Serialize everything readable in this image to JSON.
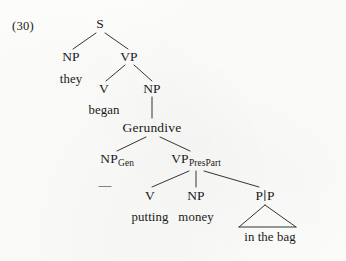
{
  "figure": {
    "example_number": "(30)",
    "background_color": "#fdfdfc",
    "ink_color": "#1a1a1a"
  },
  "tree": {
    "nodes": [
      {
        "id": "s",
        "label": "S",
        "x": 100,
        "y": 24,
        "kind": "category"
      },
      {
        "id": "np1",
        "label": "NP",
        "x": 71,
        "y": 57,
        "kind": "category"
      },
      {
        "id": "they",
        "label": "they",
        "x": 71,
        "y": 79,
        "kind": "terminal"
      },
      {
        "id": "vp1",
        "label": "VP",
        "x": 129,
        "y": 57,
        "kind": "category"
      },
      {
        "id": "v1",
        "label": "V",
        "x": 104,
        "y": 89,
        "kind": "category"
      },
      {
        "id": "began",
        "label": "began",
        "x": 104,
        "y": 111,
        "kind": "terminal"
      },
      {
        "id": "np2",
        "label": "NP",
        "x": 152,
        "y": 89,
        "kind": "category"
      },
      {
        "id": "gerundive",
        "label": "Gerundive",
        "x": 152,
        "y": 128,
        "kind": "category"
      },
      {
        "id": "npgen",
        "label": "NP",
        "sub": "Gen",
        "x": 117,
        "y": 160,
        "kind": "category"
      },
      {
        "id": "vppres",
        "label": "VP",
        "sub": "PresPart",
        "x": 196,
        "y": 160,
        "kind": "category"
      },
      {
        "id": "empty",
        "label": "—",
        "x": 105,
        "y": 185,
        "kind": "empty-category"
      },
      {
        "id": "v2",
        "label": "V",
        "x": 150,
        "y": 196,
        "kind": "category"
      },
      {
        "id": "putting",
        "label": "putting",
        "x": 150,
        "y": 218,
        "kind": "terminal"
      },
      {
        "id": "np3",
        "label": "NP",
        "x": 196,
        "y": 196,
        "kind": "category"
      },
      {
        "id": "money",
        "label": "money",
        "x": 196,
        "y": 218,
        "kind": "terminal"
      },
      {
        "id": "pp",
        "label": "PlP",
        "x": 265,
        "y": 196,
        "kind": "category"
      },
      {
        "id": "inthebag",
        "label": "in the bag",
        "x": 270,
        "y": 237,
        "kind": "terminal"
      }
    ],
    "edges": [
      {
        "from": "s",
        "to": "np1",
        "type": "branch"
      },
      {
        "from": "s",
        "to": "vp1",
        "type": "branch"
      },
      {
        "from": "vp1",
        "to": "v1",
        "type": "branch"
      },
      {
        "from": "vp1",
        "to": "np2",
        "type": "branch"
      },
      {
        "from": "np2",
        "to": "gerundive",
        "type": "vertical"
      },
      {
        "from": "gerundive",
        "to": "npgen",
        "type": "branch"
      },
      {
        "from": "gerundive",
        "to": "vppres",
        "type": "branch"
      },
      {
        "from": "vppres",
        "to": "v2",
        "type": "branch"
      },
      {
        "from": "vppres",
        "to": "np3",
        "type": "vertical"
      },
      {
        "from": "vppres",
        "to": "pp",
        "type": "branch"
      }
    ],
    "triangles": [
      {
        "under": "pp",
        "spans": "in the bag",
        "apex_x": 265,
        "apex_y": 204,
        "left_x": 238,
        "right_x": 297,
        "base_y": 228
      }
    ],
    "sentence": "they began putting money in the bag"
  }
}
